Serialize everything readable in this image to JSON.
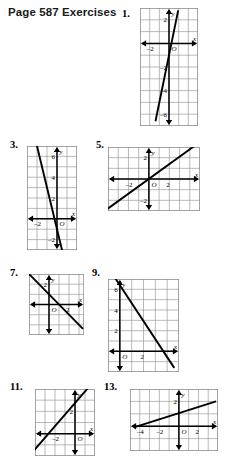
{
  "page": {
    "title": "Page 587 Exercises",
    "width": 245,
    "height": 459,
    "background": "#ffffff",
    "ink_color": "#000000",
    "grid_color": "#8c8c8c"
  },
  "exercises": [
    {
      "number": "1.",
      "num_pos": {
        "x": 122,
        "y": 8
      },
      "panel": {
        "x": 140,
        "y": 8,
        "w": 58,
        "h": 118
      },
      "chart_data": {
        "type": "line",
        "title": "Exercise 1 graph",
        "xlabel": "x",
        "ylabel": "y",
        "xlim": [
          -3,
          3
        ],
        "ylim": [
          -7,
          3
        ],
        "grid": true,
        "cell": 9.6,
        "origin_label": "O",
        "x_ticks": [
          {
            "value": -2,
            "label": "-2"
          }
        ],
        "y_ticks": [
          {
            "value": 2,
            "label": "2"
          },
          {
            "value": -2,
            "label": "-2"
          },
          {
            "value": -4,
            "label": "-4"
          },
          {
            "value": -6,
            "label": "-6"
          }
        ],
        "series": [
          {
            "name": "line1",
            "slope": 4,
            "intercept": -1,
            "points": [
              [
                -1.4,
                -6.6
              ],
              [
                0.95,
                2.8
              ]
            ]
          }
        ]
      }
    },
    {
      "number": "3.",
      "num_pos": {
        "x": 10,
        "y": 139
      },
      "panel": {
        "x": 27,
        "y": 146,
        "w": 50,
        "h": 104
      },
      "chart_data": {
        "type": "line",
        "title": "Exercise 3 graph",
        "xlabel": "x",
        "ylabel": "y",
        "xlim": [
          -3,
          2
        ],
        "ylim": [
          -3,
          7
        ],
        "grid": true,
        "cell": 10,
        "origin_label": "O",
        "x_ticks": [
          {
            "value": -2,
            "label": "-2"
          }
        ],
        "y_ticks": [
          {
            "value": 6,
            "label": "6"
          },
          {
            "value": 4,
            "label": "4"
          },
          {
            "value": 2,
            "label": "2"
          },
          {
            "value": -2,
            "label": "-2"
          }
        ],
        "series": [
          {
            "name": "line1",
            "slope": -4,
            "intercept": -1,
            "points": [
              [
                -2.1,
                7.4
              ],
              [
                0.6,
                -3.4
              ]
            ]
          }
        ]
      }
    },
    {
      "number": "5.",
      "num_pos": {
        "x": 96,
        "y": 139
      },
      "panel": {
        "x": 108,
        "y": 147,
        "w": 92,
        "h": 64
      },
      "chart_data": {
        "type": "line",
        "title": "Exercise 5 graph",
        "xlabel": "x",
        "ylabel": "y",
        "xlim": [
          -4,
          5
        ],
        "ylim": [
          -3,
          3
        ],
        "grid": true,
        "cell": 10.2,
        "origin_label": "O",
        "x_ticks": [
          {
            "value": -2,
            "label": "-2"
          },
          {
            "value": 2,
            "label": "2"
          }
        ],
        "y_ticks": [
          {
            "value": 2,
            "label": "2"
          },
          {
            "value": -2,
            "label": "-2"
          }
        ],
        "series": [
          {
            "name": "line1",
            "slope": 0.7,
            "intercept": 0,
            "points": [
              [
                -4.2,
                -2.9
              ],
              [
                4.6,
                3.2
              ]
            ]
          }
        ]
      }
    },
    {
      "number": "7.",
      "num_pos": {
        "x": 10,
        "y": 267
      },
      "panel": {
        "x": 29,
        "y": 274,
        "w": 55,
        "h": 61
      },
      "chart_data": {
        "type": "line",
        "title": "Exercise 7 graph",
        "xlabel": "x",
        "ylabel": "y",
        "xlim": [
          -2,
          3.5
        ],
        "ylim": [
          -3,
          3
        ],
        "grid": true,
        "cell": 10,
        "origin_label": "O",
        "x_ticks": [
          {
            "value": 2,
            "label": "2"
          }
        ],
        "y_ticks": [
          {
            "value": 2,
            "label": "2"
          }
        ],
        "series": [
          {
            "name": "line1",
            "slope": -1,
            "intercept": 1,
            "points": [
              [
                -2.1,
                3.1
              ],
              [
                3.4,
                -2.4
              ]
            ]
          }
        ]
      }
    },
    {
      "number": "9.",
      "num_pos": {
        "x": 92,
        "y": 267
      },
      "panel": {
        "x": 108,
        "y": 279,
        "w": 71,
        "h": 93
      },
      "chart_data": {
        "type": "line",
        "title": "Exercise 9 graph",
        "xlabel": "x",
        "ylabel": "y",
        "xlim": [
          -1,
          5
        ],
        "ylim": [
          -2,
          7
        ],
        "grid": true,
        "cell": 10.3,
        "origin_label": "O",
        "x_ticks": [
          {
            "value": 2,
            "label": "2"
          }
        ],
        "y_ticks": [
          {
            "value": 6,
            "label": "6"
          },
          {
            "value": 4,
            "label": "4"
          },
          {
            "value": 2,
            "label": "2"
          }
        ],
        "series": [
          {
            "name": "line1",
            "slope": -1.75,
            "intercept": 6.4,
            "points": [
              [
                -0.4,
                7.1
              ],
              [
                4.6,
                -1.6
              ]
            ]
          }
        ]
      }
    },
    {
      "number": "11.",
      "num_pos": {
        "x": 10,
        "y": 381
      },
      "panel": {
        "x": 35,
        "y": 389,
        "w": 60,
        "h": 67
      },
      "chart_data": {
        "type": "line",
        "title": "Exercise 11 graph",
        "xlabel": "x",
        "ylabel": "y",
        "xlim": [
          -4,
          2
        ],
        "ylim": [
          -2,
          4
        ],
        "grid": true,
        "cell": 10,
        "origin_label": "O",
        "x_ticks": [
          {
            "value": -2,
            "label": "-2"
          }
        ],
        "y_ticks": [
          {
            "value": 2,
            "label": "2"
          }
        ],
        "series": [
          {
            "name": "line1",
            "slope": 1.1,
            "intercept": 3,
            "points": [
              [
                -4.2,
                -1.6
              ],
              [
                1.6,
                4.4
              ]
            ]
          }
        ]
      }
    },
    {
      "number": "13.",
      "num_pos": {
        "x": 104,
        "y": 381
      },
      "panel": {
        "x": 130,
        "y": 389,
        "w": 88,
        "h": 62
      },
      "chart_data": {
        "type": "line",
        "title": "Exercise 13 graph",
        "xlabel": "x",
        "ylabel": "y",
        "xlim": [
          -5,
          4
        ],
        "ylim": [
          -2,
          3
        ],
        "grid": true,
        "cell": 10.2,
        "origin_label": "O",
        "x_ticks": [
          {
            "value": -4,
            "label": "-4"
          },
          {
            "value": -2,
            "label": "-2"
          },
          {
            "value": 2,
            "label": "2"
          }
        ],
        "y_ticks": [
          {
            "value": 2,
            "label": "2"
          }
        ],
        "series": [
          {
            "name": "line1",
            "slope": 0.25,
            "intercept": 1,
            "points": [
              [
                -4.6,
                -0.1
              ],
              [
                3.8,
                2.0
              ]
            ]
          }
        ]
      }
    }
  ]
}
